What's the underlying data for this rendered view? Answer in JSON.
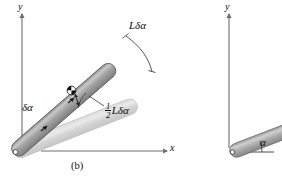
{
  "figure": {
    "caption": "(b)",
    "panels": [
      {
        "name": "left-panel",
        "axes": {
          "y_label": "y",
          "x_label": "x"
        },
        "labels": {
          "displacement_tip": "Lδα",
          "rotation_angle": "δα",
          "displacement_center_num": "1",
          "displacement_center_den": "2",
          "displacement_center_rest": "Lδα"
        }
      },
      {
        "name": "right-panel",
        "axes": {
          "y_label": "y"
        },
        "labels": {
          "angle": "α"
        }
      }
    ]
  },
  "colors": {
    "ink": "#0d0d0d",
    "rod_dark_fill": "#a8a8a8",
    "rod_dark_edge": "#4a4a4a",
    "rod_light_fill": "#d2d2d2",
    "rod_light_edge": "#c2c2c2",
    "axis": "#6e6e6e",
    "background": "#ffffff"
  }
}
